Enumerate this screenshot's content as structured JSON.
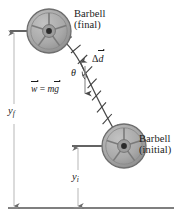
{
  "figure": {
    "background_color": "#ffffff",
    "width": 182,
    "height": 224
  },
  "labels": {
    "barbell_final": {
      "name": "Barbell",
      "state": "(final)"
    },
    "barbell_initial": {
      "name": "Barbell",
      "state": "(initial)"
    },
    "displacement": {
      "symbol": "Δ",
      "variable": "d"
    },
    "angle": {
      "symbol": "θ"
    },
    "weight_equation": {
      "lhs": "w",
      "equals": "=",
      "mass": "m",
      "gravity": "g"
    },
    "height_final": {
      "variable": "y",
      "subscript": "f"
    },
    "height_initial": {
      "variable": "y",
      "subscript": "i"
    }
  },
  "colors": {
    "plate_fill": "#a9a9a9",
    "plate_edge": "#6e6e6e",
    "hub": "#2b2b2b",
    "path_stroke": "#4a4a4a",
    "line_stroke": "#3a3a3a",
    "measure_stroke": "#b8b8b8",
    "ground_stroke": "#555555",
    "text": "#1a1a1a"
  },
  "geometry": {
    "barbell_final_center": {
      "x": 49,
      "y": 31
    },
    "barbell_initial_center": {
      "x": 124,
      "y": 146
    },
    "plate_radius": 22,
    "ground_line_y": 208,
    "measure_line_final_x": 14,
    "measure_line_initial_x": 78
  },
  "icons": {
    "plate": "weight-plate-icon",
    "arrow": "arrow-icon"
  }
}
